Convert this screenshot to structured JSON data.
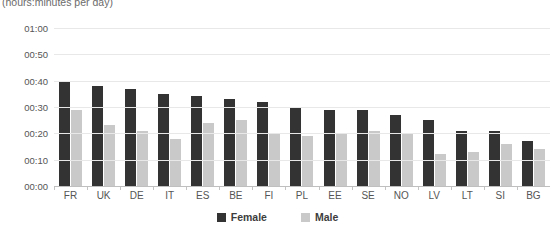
{
  "chart_data": {
    "type": "bar",
    "title": "",
    "subtitle": "(hours:minutes per day)",
    "xlabel": "",
    "ylabel": "",
    "grid": true,
    "legend_position": "bottom",
    "categories": [
      "FR",
      "UK",
      "DE",
      "IT",
      "ES",
      "BE",
      "FI",
      "PL",
      "EE",
      "SE",
      "NO",
      "LV",
      "LT",
      "SI",
      "BG"
    ],
    "ytick_labels": [
      "01:00",
      "00:50",
      "00:40",
      "00:30",
      "00:20",
      "00:10",
      "00:00"
    ],
    "ylim_minutes": [
      0,
      60
    ],
    "ytick_minutes": [
      60,
      50,
      40,
      30,
      20,
      10,
      0
    ],
    "series": [
      {
        "name": "Female",
        "color": "#333333",
        "values_label": [
          "00:40",
          "00:38",
          "00:37",
          "00:35",
          "00:34",
          "00:33",
          "00:32",
          "00:30",
          "00:29",
          "00:29",
          "00:27",
          "00:25",
          "00:21",
          "00:21",
          "00:17"
        ],
        "values": [
          40,
          38,
          37,
          35,
          34,
          33,
          32,
          30,
          29,
          29,
          27,
          25,
          21,
          21,
          17
        ]
      },
      {
        "name": "Male",
        "color": "#c9c9c9",
        "values_label": [
          "00:29",
          "00:23",
          "00:21",
          "00:18",
          "00:24",
          "00:25",
          "00:20",
          "00:19",
          "00:20",
          "00:21",
          "00:20",
          "00:12",
          "00:13",
          "00:16",
          "00:14"
        ],
        "values": [
          29,
          23,
          21,
          18,
          24,
          25,
          20,
          19,
          20,
          21,
          20,
          12,
          13,
          16,
          14
        ]
      }
    ]
  },
  "legend": {
    "items": [
      {
        "label": "Female"
      },
      {
        "label": "Male"
      }
    ]
  }
}
